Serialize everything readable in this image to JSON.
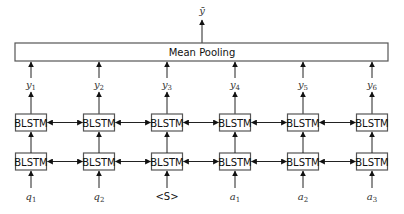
{
  "diagram": {
    "output_label": "ȳ",
    "pooling_label": "Mean Pooling",
    "cell_label": "BLSTM",
    "columns": [
      {
        "x": 31,
        "output": {
          "base": "y",
          "sub": "1"
        },
        "input": {
          "base": "q",
          "sub": "1"
        }
      },
      {
        "x": 99,
        "output": {
          "base": "y",
          "sub": "2"
        },
        "input": {
          "base": "q",
          "sub": "2"
        }
      },
      {
        "x": 167,
        "output": {
          "base": "y",
          "sub": "3"
        },
        "input": {
          "base": "<S>",
          "sub": ""
        }
      },
      {
        "x": 235,
        "output": {
          "base": "y",
          "sub": "4"
        },
        "input": {
          "base": "a",
          "sub": "1"
        }
      },
      {
        "x": 303,
        "output": {
          "base": "y",
          "sub": "5"
        },
        "input": {
          "base": "a",
          "sub": "2"
        }
      },
      {
        "x": 372,
        "output": {
          "base": "y",
          "sub": "6"
        },
        "input": {
          "base": "a",
          "sub": "3"
        }
      }
    ],
    "layers": 2
  }
}
